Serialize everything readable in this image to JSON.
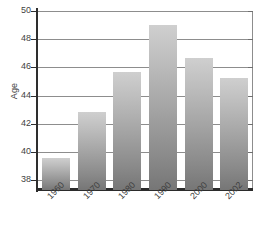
{
  "chart_data": {
    "type": "bar",
    "title": "",
    "xlabel": "",
    "ylabel": "Age",
    "categories": [
      "1960",
      "1970",
      "1980",
      "1990",
      "2000",
      "2002"
    ],
    "values": [
      39.6,
      42.85,
      45.7,
      49.0,
      46.7,
      45.25
    ],
    "ylim": [
      37.3,
      50
    ],
    "yticks": [
      38,
      40,
      42,
      44,
      46,
      48,
      50
    ],
    "ytick_labels": [
      "38",
      "40",
      "42",
      "44",
      "46",
      "48",
      "50"
    ],
    "grid": "horizontal",
    "legend": "none",
    "bar_color_top": "#cfcfcf",
    "bar_color_bottom": "#767676",
    "axis_color": "#2e2e2e",
    "gridline_color": "#8d8d8d",
    "background": "#ffffff",
    "xtick_label_rotation": -45
  }
}
